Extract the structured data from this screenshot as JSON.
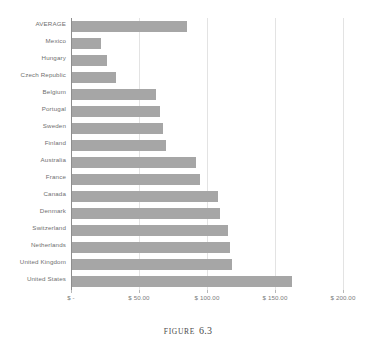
{
  "caption": {
    "word": "Figure",
    "number": "6.3"
  },
  "axis": {
    "tick_labels": [
      "$  -",
      "$ 50.00",
      "$ 100.00",
      "$ 150.00",
      "$ 200.00"
    ],
    "tick_values": [
      0,
      50,
      100,
      150,
      200
    ]
  },
  "colors": {
    "bar": "#a6a6a6",
    "gridline": "#e3e3e3",
    "axis": "#8d8d8d",
    "label_text": "#6f6f6f",
    "tick_text": "#7c7c7c",
    "background": "#ffffff"
  },
  "chart_data": {
    "type": "bar",
    "orientation": "horizontal",
    "title": "",
    "subtitle": "",
    "xlabel": "",
    "ylabel": "",
    "xlim": [
      0,
      200
    ],
    "grid": true,
    "legend": "none",
    "categories": [
      "AVERAGE",
      "Mexico",
      "Hungary",
      "Czech Republic",
      "Belgium",
      "Portugal",
      "Sweden",
      "Finland",
      "Australia",
      "France",
      "Canada",
      "Denmark",
      "Switzerland",
      "Netherlands",
      "United Kingdom",
      "United States"
    ],
    "values": [
      84.5,
      21.0,
      26.0,
      32.0,
      62.0,
      65.0,
      67.0,
      69.0,
      91.0,
      94.0,
      107.0,
      109.0,
      115.0,
      116.0,
      118.0,
      162.0
    ],
    "tick_labels": [
      "$  -",
      "$ 50.00",
      "$ 100.00",
      "$ 150.00",
      "$ 200.00"
    ]
  }
}
